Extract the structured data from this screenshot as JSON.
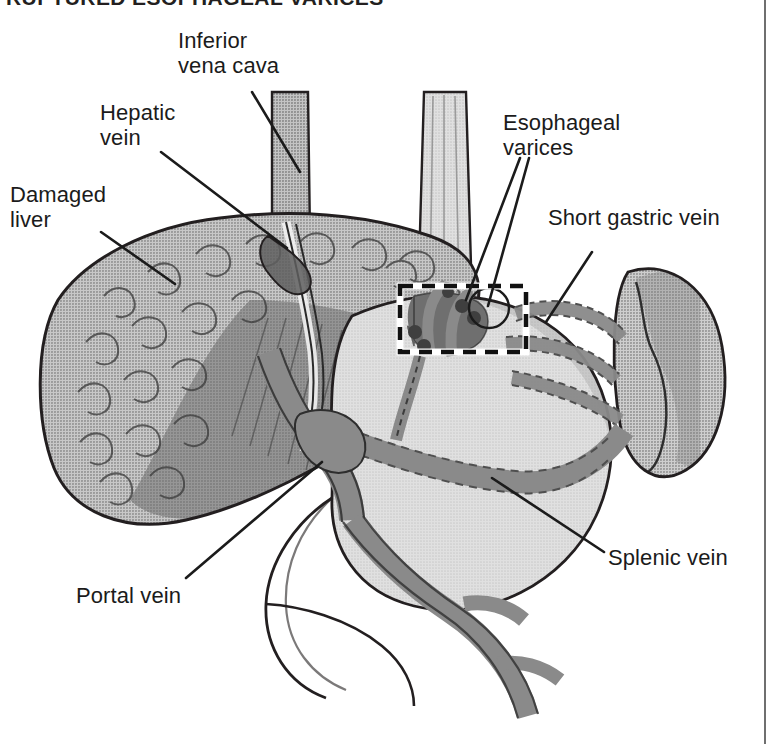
{
  "title": "RUPTURED ESOPHAGEAL VARICES",
  "figure": {
    "type": "anatomical-illustration",
    "style": "grayscale halftone medical diagram",
    "frame": {
      "right_rule": true,
      "rule_color": "#6f6f6f"
    }
  },
  "colors": {
    "ink": "#1b1b1b",
    "outline": "#231f20",
    "liver": "#9a9a9a",
    "liver_shadow": "#7d7d7d",
    "liver_dark": "#6e6e6e",
    "vein": "#8a8a8a",
    "vein_dark": "#6f6f6f",
    "varix_dark": "#4a4a4a",
    "esophagus": "#c6c6c6",
    "stomach": "#cdcdcd",
    "stomach_shade": "#b6b6b6",
    "spleen": "#9e9e9e",
    "dash_box": "#111111",
    "background": "#ffffff"
  },
  "labels": [
    {
      "id": "inferior-vena-cava",
      "text": "Inferior\nvena cava",
      "x": 178,
      "y": 28,
      "align": "left"
    },
    {
      "id": "hepatic-vein",
      "text": "Hepatic\nvein",
      "x": 100,
      "y": 100,
      "align": "left"
    },
    {
      "id": "damaged-liver",
      "text": "Damaged\nliver",
      "x": 10,
      "y": 182,
      "align": "left"
    },
    {
      "id": "esophageal-varices",
      "text": "Esophageal\nvarices",
      "x": 503,
      "y": 110,
      "align": "left"
    },
    {
      "id": "short-gastric-vein",
      "text": "Short gastric vein",
      "x": 548,
      "y": 205,
      "align": "left"
    },
    {
      "id": "splenic-vein",
      "text": "Splenic vein",
      "x": 608,
      "y": 545,
      "align": "left"
    },
    {
      "id": "portal-vein",
      "text": "Portal vein",
      "x": 76,
      "y": 583,
      "align": "left"
    }
  ],
  "leader_lines": [
    {
      "for": "inferior-vena-cava",
      "from": [
        252,
        92
      ],
      "to": [
        300,
        172
      ]
    },
    {
      "for": "hepatic-vein",
      "from": [
        161,
        152
      ],
      "to": [
        287,
        248
      ]
    },
    {
      "for": "damaged-liver",
      "from": [
        101,
        232
      ],
      "to": [
        175,
        284
      ]
    },
    {
      "for": "esophageal-varices-a",
      "from": [
        520,
        158
      ],
      "to": [
        466,
        300
      ]
    },
    {
      "for": "esophageal-varices-b",
      "from": [
        527,
        158
      ],
      "to": [
        487,
        308
      ]
    },
    {
      "for": "short-gastric-vein",
      "from": [
        592,
        252
      ],
      "to": [
        546,
        322
      ]
    },
    {
      "for": "splenic-vein",
      "from": [
        604,
        552
      ],
      "to": [
        492,
        478
      ]
    },
    {
      "for": "portal-vein",
      "from": [
        186,
        578
      ],
      "to": [
        322,
        462
      ]
    }
  ],
  "annotations": [
    {
      "id": "varices-dashed-box",
      "shape": "rect",
      "x": 400,
      "y": 286,
      "w": 126,
      "h": 66,
      "style": "black-dashed-on-white"
    },
    {
      "id": "rupture-circle",
      "shape": "circle",
      "cx": 489,
      "cy": 308,
      "r": 20,
      "style": "thin-black-outline"
    }
  ],
  "structures": [
    {
      "id": "inferior-vena-cava",
      "kind": "vessel",
      "tone": "vein"
    },
    {
      "id": "esophagus",
      "kind": "tube",
      "tone": "esophagus"
    },
    {
      "id": "damaged-liver",
      "kind": "organ",
      "tone": "liver",
      "note": "nodular cirrhotic surface"
    },
    {
      "id": "hepatic-vein",
      "kind": "vessel",
      "tone": "vein-dark"
    },
    {
      "id": "stomach",
      "kind": "organ",
      "tone": "stomach"
    },
    {
      "id": "spleen",
      "kind": "organ",
      "tone": "spleen"
    },
    {
      "id": "portal-vein",
      "kind": "vessel",
      "tone": "vein"
    },
    {
      "id": "splenic-vein",
      "kind": "vessel",
      "tone": "vein"
    },
    {
      "id": "short-gastric-vein",
      "kind": "vessel",
      "tone": "vein",
      "note": "dashed where behind stomach"
    },
    {
      "id": "superior-mesenteric-vein",
      "kind": "vessel",
      "tone": "vein"
    },
    {
      "id": "esophageal-varices",
      "kind": "vessel-cluster",
      "tone": "varix-dark"
    }
  ]
}
